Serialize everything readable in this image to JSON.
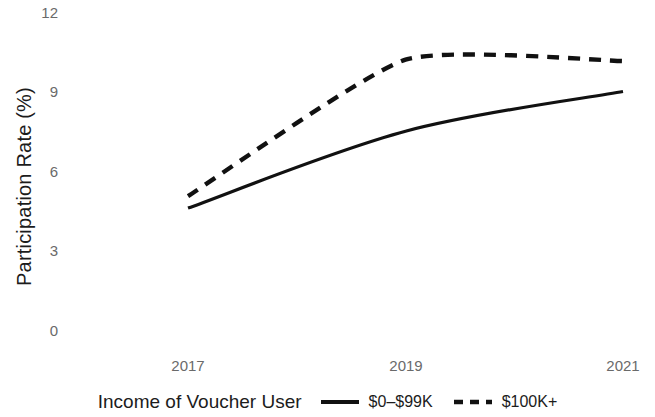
{
  "chart_data": {
    "type": "line",
    "title": "",
    "xlabel": "",
    "ylabel": "Participation Rate (%)",
    "x": [
      2017,
      2019,
      2021
    ],
    "xtick_labels": [
      "2017",
      "2019",
      "2021"
    ],
    "ytick_labels": [
      "0",
      "3",
      "6",
      "9",
      "12"
    ],
    "ytick_values": [
      0,
      3,
      6,
      9,
      12
    ],
    "ylim": [
      0,
      12
    ],
    "xlim": [
      2017,
      2021
    ],
    "grid": false,
    "legend_position": "bottom",
    "legend_title": "Income of Voucher User",
    "series": [
      {
        "name": "$0–$99K",
        "style": "solid",
        "color": "#111111",
        "values": [
          4.6,
          7.5,
          9.0
        ]
      },
      {
        "name": "$100K+",
        "style": "dashed",
        "color": "#111111",
        "values": [
          5.05,
          10.2,
          10.15
        ]
      }
    ]
  },
  "axes": {
    "y_label": "Participation Rate (%)",
    "y_ticks": [
      "12",
      "9",
      "6",
      "3",
      "0"
    ],
    "x_ticks": [
      "2017",
      "2019",
      "2021"
    ]
  },
  "legend": {
    "title": "Income of Voucher User",
    "entries": [
      {
        "label": "$0–$99K",
        "style": "solid"
      },
      {
        "label": "$100K+",
        "style": "dashed"
      }
    ]
  }
}
